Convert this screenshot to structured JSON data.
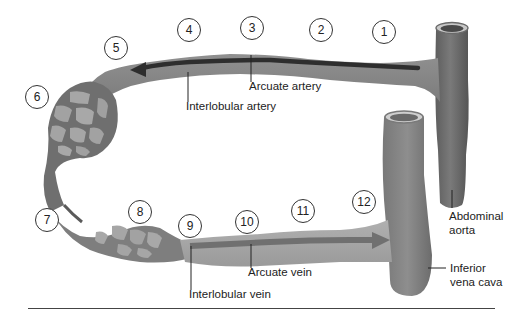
{
  "diagram": {
    "steps": [
      {
        "num": "1",
        "x": 372,
        "y": 20
      },
      {
        "num": "2",
        "x": 309,
        "y": 18
      },
      {
        "num": "3",
        "x": 240,
        "y": 16
      },
      {
        "num": "4",
        "x": 177,
        "y": 18
      },
      {
        "num": "5",
        "x": 104,
        "y": 36
      },
      {
        "num": "6",
        "x": 25,
        "y": 85
      },
      {
        "num": "7",
        "x": 35,
        "y": 208
      },
      {
        "num": "8",
        "x": 128,
        "y": 200
      },
      {
        "num": "9",
        "x": 178,
        "y": 214
      },
      {
        "num": "10",
        "x": 235,
        "y": 210
      },
      {
        "num": "11",
        "x": 291,
        "y": 199
      },
      {
        "num": "12",
        "x": 352,
        "y": 190
      }
    ],
    "labels": {
      "arcuate_artery": "Arcuate artery",
      "interlobular_artery": "Interlobular artery",
      "arcuate_vein": "Arcuate vein",
      "interlobular_vein": "Interlobular vein",
      "abdominal_aorta_line1": "Abdominal",
      "abdominal_aorta_line2": "aorta",
      "inferior_vena_cava_line1": "Inferior",
      "inferior_vena_cava_line2": "vena cava"
    },
    "colors": {
      "vessel_dark": "#6e6e6e",
      "vessel_mid": "#8a8a8a",
      "vessel_light": "#a8a8a8",
      "arrow": "#2e2e2e",
      "background": "#ffffff"
    }
  }
}
